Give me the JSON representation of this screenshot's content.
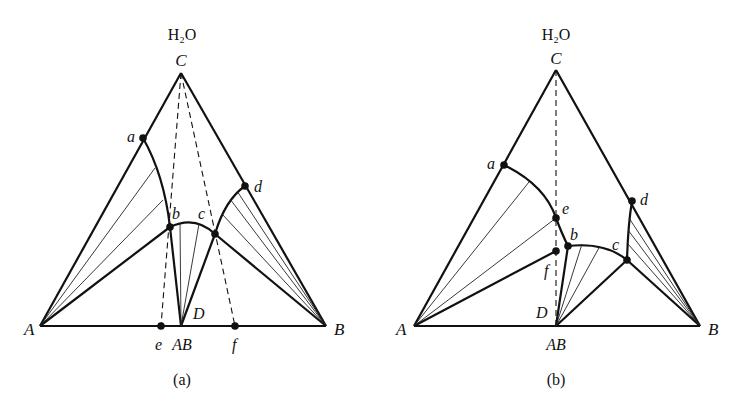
{
  "figure": {
    "panels": [
      {
        "id": "a",
        "caption": "(a)",
        "top_label": "H₂O",
        "vertices": {
          "A": "A",
          "B": "B",
          "C": "C"
        },
        "points": {
          "a": "a",
          "b": "b",
          "c": "c",
          "d": "d",
          "D": "D",
          "e": "e",
          "f": "f"
        },
        "compound_label": "AB"
      },
      {
        "id": "b",
        "caption": "(b)",
        "top_label": "H₂O",
        "vertices": {
          "A": "A",
          "B": "B",
          "C": "C"
        },
        "points": {
          "a": "a",
          "b": "b",
          "c": "c",
          "d": "d",
          "D": "D",
          "e": "e",
          "f": "f"
        },
        "compound_label": "AB"
      }
    ]
  }
}
